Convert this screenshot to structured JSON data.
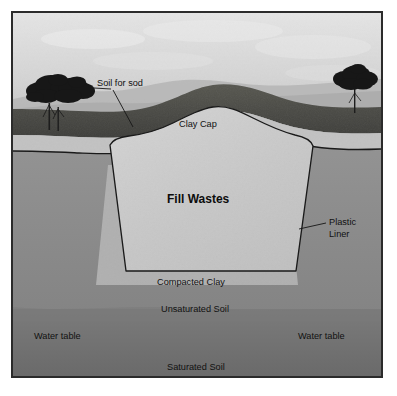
{
  "figure": {
    "frame_border_color": "#2b2b2b",
    "background_color": "#ffffff"
  },
  "labels": {
    "soil_for_sod": "Soil for sod",
    "clay_cap": "Clay Cap",
    "fill_wastes": "Fill Wastes",
    "plastic_liner_line1": "Plastic",
    "plastic_liner_line2": "Liner",
    "compacted_clay": "Compacted Clay",
    "unsaturated_soil": "Unsaturated Soil",
    "water_table_left": "Water table",
    "water_table_right": "Water table",
    "saturated_soil": "Saturated Soil"
  },
  "colors": {
    "sky": "#d9d9d9",
    "sky_haze": "#c6c6c6",
    "distant_hills": "#b9b9b9",
    "grass_sod": "#4a4a48",
    "clay_cap": "#c3c3c3",
    "fill_wastes": "#c9c9c9",
    "unsaturated_soil": "#8d8d8d",
    "saturated_soil": "#6f6f6f",
    "compacted_clay": "#b5b5b5",
    "tree": "#1e1e1e",
    "outline": "#1a1a1a",
    "text": "#111111"
  },
  "zones": [
    {
      "name": "sky",
      "label": ""
    },
    {
      "name": "soil-for-sod",
      "label": "Soil for sod"
    },
    {
      "name": "clay-cap",
      "label": "Clay Cap"
    },
    {
      "name": "fill-wastes",
      "label": "Fill Wastes"
    },
    {
      "name": "plastic-liner",
      "label": "Plastic Liner"
    },
    {
      "name": "compacted-clay",
      "label": "Compacted Clay"
    },
    {
      "name": "unsaturated-soil",
      "label": "Unsaturated Soil"
    },
    {
      "name": "saturated-soil",
      "label": "Saturated Soil"
    }
  ]
}
